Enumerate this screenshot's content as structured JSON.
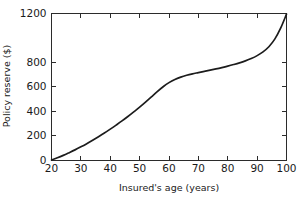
{
  "chart_data": {
    "type": "line",
    "title": "",
    "xlabel": "Insured's age (years)",
    "ylabel": "Policy reserve ($)",
    "xlim": [
      20,
      100
    ],
    "ylim": [
      0,
      1200
    ],
    "xticks": [
      20,
      30,
      40,
      50,
      60,
      70,
      80,
      90,
      100
    ],
    "xtick_labels": [
      "20",
      "30",
      "40",
      "50",
      "60",
      "70",
      "80",
      "90",
      "100"
    ],
    "yticks": [
      0,
      200,
      400,
      600,
      800,
      1200
    ],
    "ytick_labels": [
      "0",
      "200",
      "400",
      "600",
      "800",
      "1200"
    ],
    "grid": false,
    "legend": false,
    "line_color": "#1c1c1c",
    "series": [
      {
        "name": "Policy reserve",
        "x": [
          20,
          22,
          24,
          26,
          28,
          30,
          32,
          34,
          36,
          38,
          40,
          42,
          44,
          46,
          48,
          50,
          52,
          54,
          56,
          58,
          60,
          62,
          64,
          66,
          68,
          70,
          72,
          74,
          76,
          78,
          80,
          82,
          84,
          86,
          88,
          90,
          92,
          94,
          96,
          98,
          100
        ],
        "y": [
          0,
          18,
          38,
          60,
          83,
          108,
          134,
          162,
          191,
          221,
          253,
          286,
          320,
          356,
          394,
          433,
          474,
          517,
          560,
          600,
          634,
          660,
          679,
          694,
          706,
          716,
          726,
          736,
          746,
          757,
          769,
          782,
          796,
          812,
          831,
          855,
          886,
          928,
          990,
          1080,
          1195
        ]
      }
    ]
  }
}
